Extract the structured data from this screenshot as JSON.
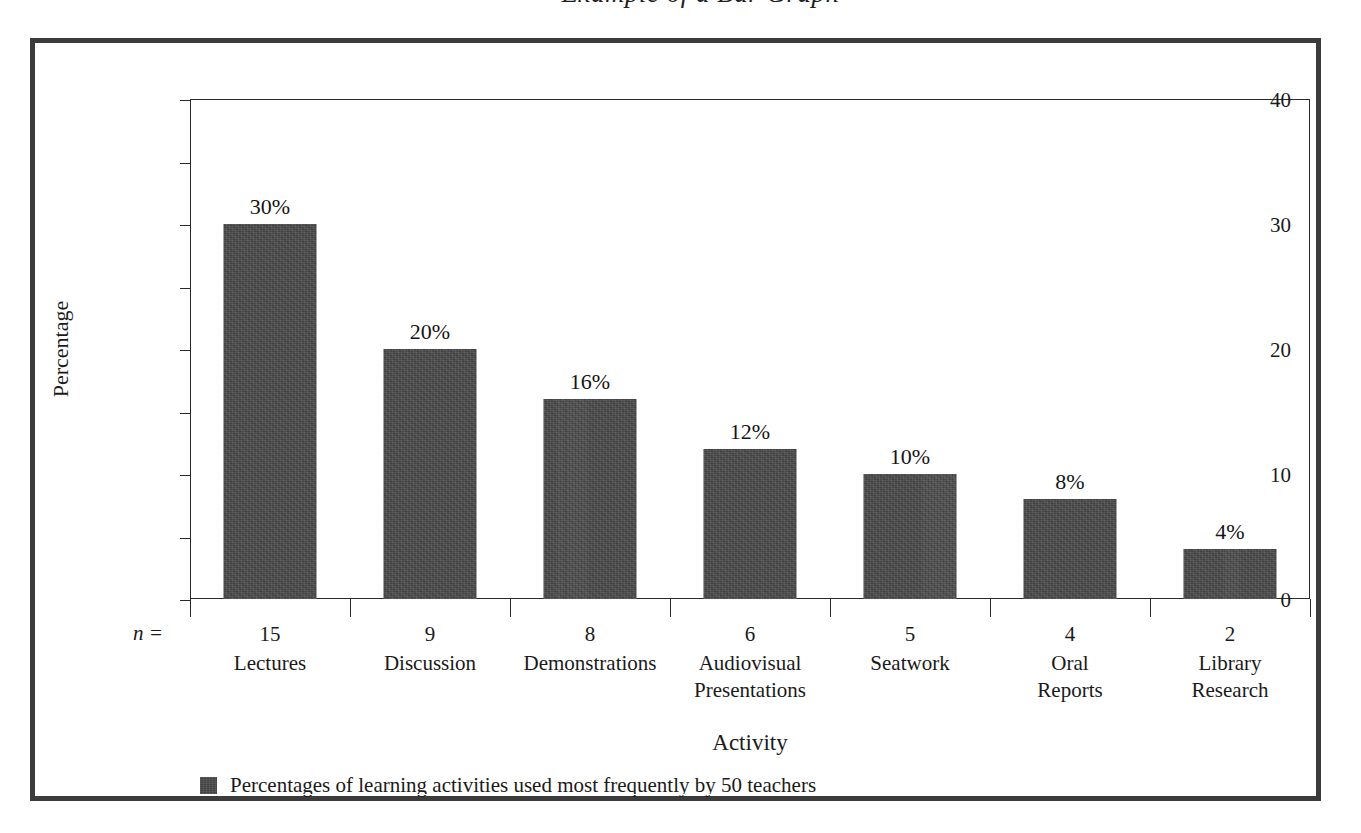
{
  "figure": {
    "title": "Example of a Bar Graph"
  },
  "axes": {
    "y_title": "Percentage",
    "x_title": "Activity",
    "n_marker": "n ="
  },
  "legend": {
    "swatch_color": "#4a4a4a",
    "label": "Percentages of learning activities used most frequently by 50 teachers"
  },
  "colors": {
    "bar": "#4a4a4a",
    "frame": "#3b3b3b",
    "axis": "#2a2a2a",
    "text": "#1a1a1a",
    "background": "#ffffff"
  },
  "chart_data": {
    "type": "bar",
    "title": "Example of a Bar Graph",
    "xlabel": "Activity",
    "ylabel": "Percentage",
    "ylim": [
      0,
      40
    ],
    "ytick_major": [
      0,
      10,
      20,
      30,
      40
    ],
    "ytick_minor": [
      5,
      15,
      25,
      35
    ],
    "ytick_labels": [
      "0",
      "10",
      "20",
      "30",
      "40"
    ],
    "grid": false,
    "legend_position": "below-plot-left",
    "categories": [
      "Lectures",
      "Discussion",
      "Demonstrations",
      "Audiovisual Presentations",
      "Seatwork",
      "Oral Reports",
      "Library Research"
    ],
    "category_lines": [
      [
        "Lectures"
      ],
      [
        "Discussion"
      ],
      [
        "Demonstrations"
      ],
      [
        "Audiovisual",
        "Presentations"
      ],
      [
        "Seatwork"
      ],
      [
        "Oral",
        "Reports"
      ],
      [
        "Library",
        "Research"
      ]
    ],
    "values": [
      30,
      20,
      16,
      12,
      10,
      8,
      4
    ],
    "value_labels": [
      "30%",
      "20%",
      "16%",
      "12%",
      "10%",
      "8%",
      "4%"
    ],
    "n_values": [
      15,
      9,
      8,
      6,
      5,
      4,
      2
    ],
    "n_labels": [
      "15",
      "9",
      "8",
      "6",
      "5",
      "4",
      "2"
    ],
    "series": [
      {
        "name": "Percentages of learning activities used most frequently by 50 teachers",
        "values": [
          30,
          20,
          16,
          12,
          10,
          8,
          4
        ]
      }
    ]
  }
}
